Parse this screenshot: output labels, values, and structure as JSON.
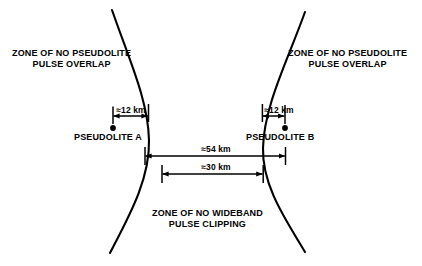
{
  "diagram": {
    "stroke_color": "#000000",
    "background_color": "#ffffff",
    "zones": {
      "left_zone": {
        "line1": "ZONE OF NO PSEUDOLITE",
        "line2": "PULSE OVERLAP"
      },
      "right_zone": {
        "line1": "ZONE OF NO PSEUDOLITE",
        "line2": "PULSE OVERLAP"
      },
      "bottom_zone": {
        "line1": "ZONE OF NO WIDEBAND",
        "line2": "PULSE CLIPPING"
      }
    },
    "nodes": [
      {
        "id": "pseudolite-a",
        "label": "PSEUDOLITE A",
        "x": 113,
        "y": 128
      },
      {
        "id": "pseudolite-b",
        "label": "PSEUDOLITE B",
        "x": 285,
        "y": 128
      }
    ],
    "dimensions": [
      {
        "id": "dim-12-left",
        "label": "≈12 km",
        "value": 12,
        "unit": "km",
        "approx": true
      },
      {
        "id": "dim-12-right",
        "label": "≈12 km",
        "value": 12,
        "unit": "km",
        "approx": true
      },
      {
        "id": "dim-54",
        "label": "≈54 km",
        "value": 54,
        "unit": "km",
        "approx": true
      },
      {
        "id": "dim-30",
        "label": "≈30 km",
        "value": 30,
        "unit": "km",
        "approx": true
      }
    ]
  }
}
